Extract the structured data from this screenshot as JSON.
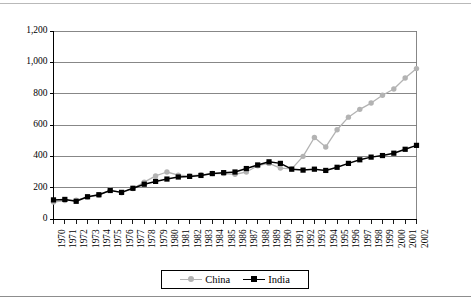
{
  "chart_data": {
    "type": "line",
    "title": "",
    "subtitle": "",
    "xlabel": "",
    "ylabel": "",
    "ylim": [
      0,
      1200
    ],
    "ytick_step": 200,
    "ytick_labels": [
      "0",
      "200",
      "400",
      "600",
      "800",
      "1,000",
      "1,200"
    ],
    "ytick_values": [
      0,
      200,
      400,
      600,
      800,
      1000,
      1200
    ],
    "grid": true,
    "grid_axis": "y",
    "legend_position": "bottom",
    "categories": [
      "1970",
      "1971",
      "1972",
      "1973",
      "1974",
      "1975",
      "1976",
      "1977",
      "1978",
      "1979",
      "1980",
      "1981",
      "1982",
      "1983",
      "1984",
      "1985",
      "1986",
      "1987",
      "1988",
      "1989",
      "1990",
      "1991",
      "1992",
      "1993",
      "1994",
      "1995",
      "1996",
      "1997",
      "1998",
      "1999",
      "2000",
      "2001",
      "2002"
    ],
    "series": [
      {
        "name": "China",
        "color": "#b3b3b3",
        "marker": "circle",
        "values": [
          108,
          118,
          120,
          140,
          152,
          185,
          168,
          195,
          235,
          275,
          300,
          280,
          275,
          282,
          290,
          290,
          285,
          300,
          340,
          355,
          325,
          320,
          400,
          520,
          460,
          570,
          650,
          700,
          740,
          790,
          830,
          900,
          960
        ]
      },
      {
        "name": "India",
        "color": "#000000",
        "marker": "square",
        "values": [
          122,
          125,
          113,
          142,
          155,
          182,
          170,
          196,
          222,
          240,
          255,
          268,
          272,
          278,
          290,
          296,
          300,
          322,
          345,
          365,
          355,
          318,
          312,
          318,
          310,
          330,
          355,
          378,
          395,
          405,
          420,
          445,
          470
        ]
      }
    ]
  },
  "legend": {
    "items": [
      {
        "label": "China"
      },
      {
        "label": "India"
      }
    ]
  },
  "colors": {
    "china": "#b3b3b3",
    "india": "#000000",
    "grid": "#7a7a7a",
    "axis": "#000000",
    "background": "#ffffff"
  }
}
